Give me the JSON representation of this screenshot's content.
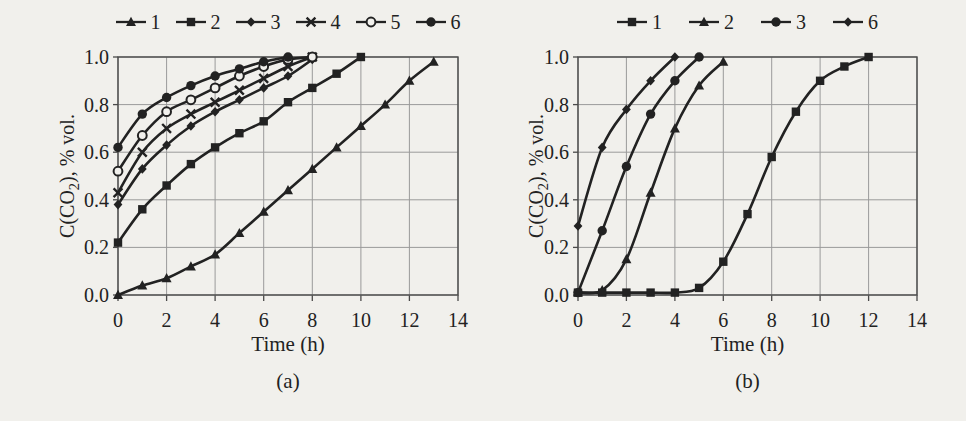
{
  "figure": {
    "background": "#f1f0ec",
    "ink": "#222222",
    "grid_color": "#9a9a9a",
    "border_color": "#4a4a4a"
  },
  "chart_data": [
    {
      "id": "a",
      "type": "line",
      "caption": "(a)",
      "xlabel": "Time (h)",
      "ylabel": "C(CO₂), % vol.",
      "ylabel_parts": {
        "pre": "C(CO",
        "sub": "2",
        "post": "), % vol."
      },
      "xlim": [
        0,
        14
      ],
      "ylim": [
        0.0,
        1.0
      ],
      "xticks": [
        0,
        2,
        4,
        6,
        8,
        10,
        12,
        14
      ],
      "yticks": [
        0.0,
        0.2,
        0.4,
        0.6,
        0.8,
        1.0
      ],
      "grid": true,
      "legend_position": "top",
      "series": [
        {
          "name": "1",
          "marker": "triangle",
          "x": [
            0,
            1,
            2,
            3,
            4,
            5,
            6,
            7,
            8,
            9,
            10,
            11,
            12,
            13
          ],
          "y": [
            0.0,
            0.04,
            0.07,
            0.12,
            0.17,
            0.26,
            0.35,
            0.44,
            0.53,
            0.62,
            0.71,
            0.8,
            0.9,
            0.98
          ]
        },
        {
          "name": "2",
          "marker": "square",
          "x": [
            0,
            1,
            2,
            3,
            4,
            5,
            6,
            7,
            8,
            9,
            10
          ],
          "y": [
            0.22,
            0.36,
            0.46,
            0.55,
            0.62,
            0.68,
            0.73,
            0.81,
            0.87,
            0.93,
            1.0
          ]
        },
        {
          "name": "3",
          "marker": "diamond",
          "x": [
            0,
            1,
            2,
            3,
            4,
            5,
            6,
            7,
            8
          ],
          "y": [
            0.38,
            0.53,
            0.63,
            0.71,
            0.77,
            0.82,
            0.87,
            0.92,
            0.99
          ]
        },
        {
          "name": "4",
          "marker": "x",
          "x": [
            0,
            1,
            2,
            3,
            4,
            5,
            6,
            7,
            8
          ],
          "y": [
            0.43,
            0.6,
            0.7,
            0.76,
            0.81,
            0.86,
            0.91,
            0.96,
            1.0
          ]
        },
        {
          "name": "5",
          "marker": "circle-open",
          "x": [
            0,
            1,
            2,
            3,
            4,
            5,
            6,
            7,
            8
          ],
          "y": [
            0.52,
            0.67,
            0.77,
            0.82,
            0.87,
            0.92,
            0.96,
            0.99,
            1.0
          ]
        },
        {
          "name": "6",
          "marker": "circle",
          "x": [
            0,
            1,
            2,
            3,
            4,
            5,
            6,
            7
          ],
          "y": [
            0.62,
            0.76,
            0.83,
            0.88,
            0.92,
            0.95,
            0.98,
            1.0
          ]
        }
      ]
    },
    {
      "id": "b",
      "type": "line",
      "caption": "(b)",
      "xlabel": "Time (h)",
      "ylabel": "C(CO₂), % vol.",
      "ylabel_parts": {
        "pre": "C(CO",
        "sub": "2",
        "post": "), % vol."
      },
      "xlim": [
        0,
        14
      ],
      "ylim": [
        0.0,
        1.0
      ],
      "xticks": [
        0,
        2,
        4,
        6,
        8,
        10,
        12,
        14
      ],
      "yticks": [
        0.0,
        0.2,
        0.4,
        0.6,
        0.8,
        1.0
      ],
      "grid": true,
      "legend_position": "top",
      "series": [
        {
          "name": "1",
          "marker": "square",
          "x": [
            0,
            1,
            2,
            3,
            4,
            5,
            6,
            7,
            8,
            9,
            10,
            11,
            12
          ],
          "y": [
            0.01,
            0.01,
            0.01,
            0.01,
            0.01,
            0.03,
            0.14,
            0.34,
            0.58,
            0.77,
            0.9,
            0.96,
            1.0
          ]
        },
        {
          "name": "2",
          "marker": "triangle",
          "x": [
            0,
            1,
            2,
            3,
            4,
            5,
            6
          ],
          "y": [
            0.01,
            0.02,
            0.15,
            0.43,
            0.7,
            0.88,
            0.98
          ]
        },
        {
          "name": "3",
          "marker": "circle",
          "x": [
            0,
            1,
            2,
            3,
            4,
            5
          ],
          "y": [
            0.01,
            0.27,
            0.54,
            0.76,
            0.9,
            1.0
          ]
        },
        {
          "name": "6",
          "marker": "diamond",
          "x": [
            0,
            1,
            2,
            3,
            4
          ],
          "y": [
            0.29,
            0.62,
            0.78,
            0.9,
            1.0
          ]
        }
      ]
    }
  ]
}
